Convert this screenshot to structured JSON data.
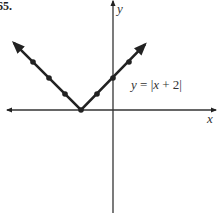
{
  "problem_number": "65.",
  "colors": {
    "ink": "#222222",
    "axis": "#333333",
    "background": "#ffffff"
  },
  "chart_data": {
    "type": "line",
    "title": "",
    "equation_label": "y = |x + 2|",
    "equation_parts": {
      "lhs": "y",
      "eq": " = ",
      "bar1": "|",
      "x": "x",
      "rest": " + 2",
      "bar2": "|"
    },
    "xlabel": "x",
    "ylabel": "y",
    "grid": false,
    "xlim": [
      -6.6,
      6.4
    ],
    "ylim": [
      -6.3,
      6.8
    ],
    "series": [
      {
        "name": "y = |x + 2|",
        "x": [
          -5,
          -4,
          -3,
          -2,
          -1,
          0,
          1
        ],
        "values": [
          3,
          2,
          1,
          0,
          1,
          2,
          3
        ],
        "markers": true,
        "arrows_both_ends": true,
        "arrow_left_end": [
          -6.2,
          4.2
        ],
        "arrow_right_end": [
          2.0,
          4.1
        ]
      }
    ]
  }
}
